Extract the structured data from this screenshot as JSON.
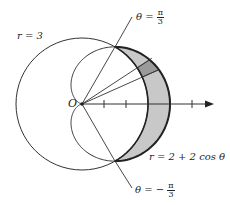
{
  "labels": {
    "circle": "r = 3",
    "cardioid": "r = 2 + 2 cos θ",
    "origin": "O",
    "theta_top_prefix": "θ =",
    "theta_top_num": "π",
    "theta_top_den": "3",
    "theta_bottom_prefix": "θ = −",
    "theta_bottom_num": "π",
    "theta_bottom_den": "3"
  },
  "colors": {
    "stroke": "#333333",
    "shade": "#c8c8c8",
    "element": "#9a9a9a"
  },
  "geometry": {
    "origin": [
      82,
      104
    ],
    "unit_px": 22,
    "circle_r": 3,
    "cardioid": "2+2cos(theta)",
    "theta_range": [
      "-pi/3",
      "pi/3"
    ]
  }
}
